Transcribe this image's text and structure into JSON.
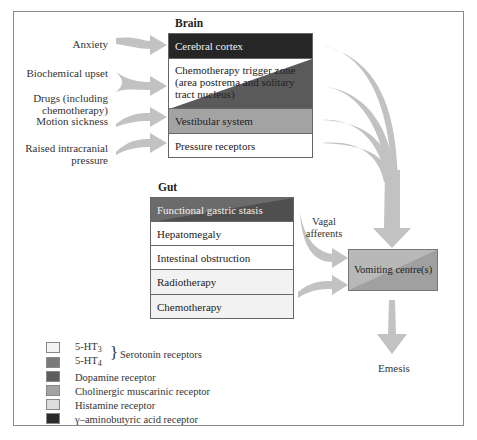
{
  "colors": {
    "gaba": "#2b2b2b",
    "dopamine": "#5e5e5e",
    "cholinergic": "#a3a3a3",
    "histamine": "#dcdcdc",
    "ht3": "#f4f4f4",
    "ht4": "#7a7a7a",
    "arrow": "#bdbdbd"
  },
  "stimuli": [
    {
      "label": "Anxiety"
    },
    {
      "label": "Biochemical upset"
    },
    {
      "label": "Drugs (including chemotherapy)"
    },
    {
      "label": "Motion sickness"
    },
    {
      "label": "Raised intracranial pressure"
    }
  ],
  "brain": {
    "heading": "Brain",
    "rows": [
      {
        "label": "Cerebral cortex"
      },
      {
        "label": "Chemotherapy trigger zone (area postrema and solitary tract nucleus)"
      },
      {
        "label": "Vestibular system"
      },
      {
        "label": "Pressure receptors"
      }
    ]
  },
  "gut": {
    "heading": "Gut",
    "rows": [
      {
        "label": "Functional gastric stasis"
      },
      {
        "label": "Hepatomegaly"
      },
      {
        "label": "Intestinal obstruction"
      },
      {
        "label": "Radiotherapy"
      },
      {
        "label": "Chemotherapy"
      }
    ]
  },
  "vagal_label": "Vagal afferents",
  "vomiting_centre": "Vomiting centre(s)",
  "outcome": "Emesis",
  "legend": {
    "ht3": "5-HT",
    "ht3_sub": "3",
    "ht4": "5-HT",
    "ht4_sub": "4",
    "serotonin_group": "Serotonin receptors",
    "items": [
      {
        "label": "Dopamine receptor"
      },
      {
        "label": "Cholinergic muscarinic receptor"
      },
      {
        "label": "Histamine receptor"
      },
      {
        "label": "γ–aminobutyric acid receptor"
      }
    ]
  }
}
